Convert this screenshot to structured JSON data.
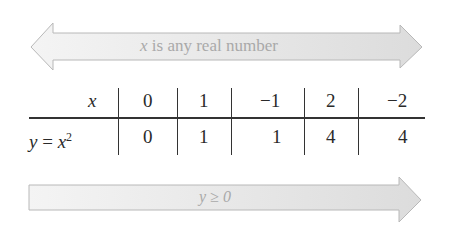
{
  "top_arrow": {
    "label_var": "x",
    "label_rest": " is any real number",
    "direction": "both"
  },
  "table": {
    "header": {
      "label": "x",
      "values": [
        "0",
        "1",
        "−1",
        "2",
        "−2"
      ]
    },
    "row": {
      "label_y": "y",
      "label_eq": " = ",
      "label_x": "x",
      "label_exp": "2",
      "values": [
        "0",
        "1",
        "1",
        "4",
        "4"
      ]
    }
  },
  "bottom_arrow": {
    "label": "y ≥ 0",
    "direction": "right"
  },
  "colors": {
    "arrow_fill": "#e6e6e6",
    "arrow_stroke": "#b5b5b5",
    "arrow_text": "#a9a9a9",
    "ink": "#2a2a2a"
  }
}
